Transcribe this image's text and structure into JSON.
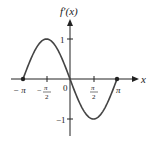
{
  "chart_data": {
    "type": "line",
    "title": "",
    "ylabel": "f'(x)",
    "xlabel": "x",
    "xlim": [
      -3.14159,
      3.14159
    ],
    "ylim": [
      -1,
      1
    ],
    "x_ticks": [
      "-π",
      "-π/2",
      "0",
      "π/2",
      "π"
    ],
    "y_ticks": [
      "1",
      "-1"
    ],
    "series": [
      {
        "name": "f'(x)",
        "x": [
          -3.14159,
          -1.5708,
          0,
          1.5708,
          3.14159
        ],
        "values": [
          0,
          1,
          0,
          -1,
          0
        ]
      }
    ],
    "endpoints": [
      [
        -3.14159,
        0
      ],
      [
        3.14159,
        0
      ]
    ],
    "grid": false
  },
  "labels": {
    "y_axis": "f′(x)",
    "x_axis": "x",
    "origin": "0",
    "neg_pi": "− π",
    "pi": "π",
    "neg_half": "−",
    "half_num": "π",
    "half_den": "2",
    "y_one": "1",
    "y_neg_one": "−1"
  }
}
